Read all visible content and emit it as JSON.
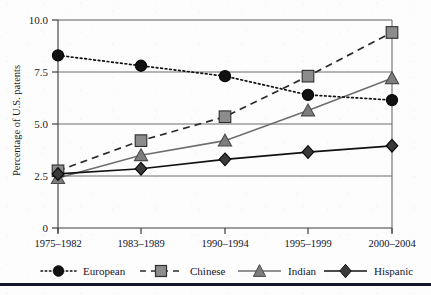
{
  "chart_data": {
    "type": "line",
    "title": "",
    "subtitle": "",
    "xlabel": "",
    "ylabel": "Percentage of U.S. patents",
    "categories": [
      "1975–1982",
      "1983–1989",
      "1990–1994",
      "1995–1999",
      "2000–2004"
    ],
    "ylim": [
      0,
      10.0
    ],
    "yticks": [
      0,
      2.5,
      5.0,
      7.5,
      10.0
    ],
    "ytick_labels": [
      "0",
      "2.5",
      "5.0",
      "7.5",
      "10.0"
    ],
    "grid": true,
    "legend_position": "bottom",
    "series": [
      {
        "name": "European",
        "values": [
          8.3,
          7.8,
          7.3,
          6.4,
          6.15
        ],
        "line_style": "dotted",
        "marker": "circle",
        "color": "#111111",
        "marker_fill": "#111111"
      },
      {
        "name": "Chinese",
        "values": [
          2.75,
          4.2,
          5.35,
          7.3,
          9.4
        ],
        "line_style": "dashed",
        "marker": "square",
        "color": "#2b2b2b",
        "marker_fill": "#8c8c8c"
      },
      {
        "name": "Indian",
        "values": [
          2.4,
          3.5,
          4.2,
          5.65,
          7.2
        ],
        "line_style": "solid",
        "marker": "triangle",
        "color": "#6e6e6e",
        "marker_fill": "#7d7d7d"
      },
      {
        "name": "Hispanic",
        "values": [
          2.6,
          2.85,
          3.3,
          3.65,
          3.95
        ],
        "line_style": "solid",
        "marker": "diamond",
        "color": "#111111",
        "marker_fill": "#3a3a3a"
      }
    ]
  },
  "axes": {
    "y_axis_label": "Percentage of U.S. patents",
    "y_tick_0": "0",
    "y_tick_1": "2.5",
    "y_tick_2": "5.0",
    "y_tick_3": "7.5",
    "y_tick_4": "10.0",
    "x_tick_0": "1975–1982",
    "x_tick_1": "1983–1989",
    "x_tick_2": "1990–1994",
    "x_tick_3": "1995–1999",
    "x_tick_4": "2000–2004"
  },
  "legend": {
    "items": [
      {
        "label": "European",
        "marker": "circle-icon",
        "color": "#111111"
      },
      {
        "label": "Chinese",
        "marker": "square-icon",
        "color": "#8c8c8c"
      },
      {
        "label": "Indian",
        "marker": "triangle-icon",
        "color": "#7d7d7d"
      },
      {
        "label": "Hispanic",
        "marker": "diamond-icon",
        "color": "#3a3a3a"
      }
    ]
  },
  "style": {
    "grid_color": "#6b6b6b",
    "axis_color": "#4a4a4a",
    "background": "#fdfdfd"
  }
}
